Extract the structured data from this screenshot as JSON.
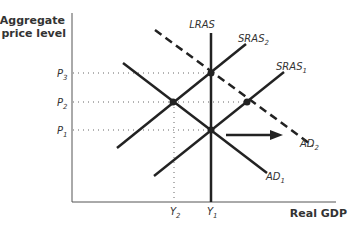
{
  "diagram": {
    "type": "AD-AS model",
    "y_axis_title": [
      "Aggregate",
      "price level"
    ],
    "x_axis_title": "Real GDP",
    "curves": {
      "lras": {
        "label": "LRAS",
        "sub": ""
      },
      "sras1": {
        "label": "SRAS",
        "sub": "1"
      },
      "sras2": {
        "label": "SRAS",
        "sub": "2"
      },
      "ad1": {
        "label": "AD",
        "sub": "1"
      },
      "ad2": {
        "label": "AD",
        "sub": "2"
      }
    },
    "price_levels": [
      {
        "label": "P",
        "sub": "3"
      },
      {
        "label": "P",
        "sub": "2"
      },
      {
        "label": "P",
        "sub": "1"
      }
    ],
    "output_levels": [
      {
        "label": "Y",
        "sub": "2"
      },
      {
        "label": "Y",
        "sub": "1"
      }
    ],
    "shift_arrow": "AD1 to AD2 (rightward shift)",
    "colors": {
      "line": "#222222",
      "axis": "#555555",
      "dotted": "#666666"
    }
  }
}
